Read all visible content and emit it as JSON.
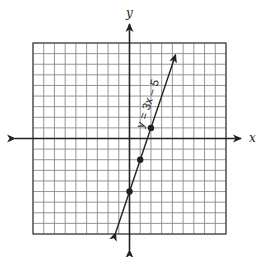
{
  "chart_data": {
    "type": "line",
    "title": "",
    "xlabel": "x",
    "ylabel": "y",
    "xlim": [
      -9,
      9
    ],
    "ylim": [
      -9,
      9
    ],
    "grid": true,
    "grid_step": 1,
    "series": [
      {
        "name": "y = 3x – 5",
        "equation": "y = 3x - 5",
        "slope": 3,
        "intercept": -5,
        "line_extent": {
          "x": [
            -1.3,
            4.3
          ],
          "y": [
            -8.9,
            7.9
          ]
        },
        "arrows_both_ends": true,
        "marked_points": [
          {
            "x": 0,
            "y": -5
          },
          {
            "x": 1,
            "y": -2
          },
          {
            "x": 2,
            "y": 1
          }
        ]
      }
    ],
    "annotations": [
      {
        "text": "y = 3x – 5",
        "position": "along line, upper segment",
        "rotation_deg": -71.6
      }
    ]
  },
  "labels": {
    "x_axis": "x",
    "y_axis": "y",
    "equation": "y = 3x – 5"
  },
  "colors": {
    "grid": "#8a8a8a",
    "border": "#444444",
    "axis": "#222222",
    "line": "#222222"
  }
}
